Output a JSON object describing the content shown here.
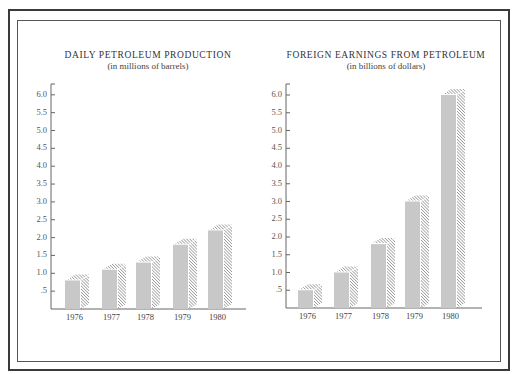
{
  "header": {
    "partial_heading": "GROWTH OF PETROLEUM SECTOR"
  },
  "colors": {
    "bar_fill": "#c8c8c8",
    "hatch": "#555555",
    "axis": "#666666",
    "frame": "#3a3a3a"
  },
  "chart_data": [
    {
      "type": "bar",
      "title": "DAILY PETROLEUM PRODUCTION",
      "subtitle": "(in millions of barrels)",
      "xlabel": "",
      "ylabel": "",
      "categories": [
        "1976",
        "1977",
        "1978",
        "1979",
        "1980"
      ],
      "values": [
        0.8,
        1.1,
        1.3,
        1.8,
        2.2
      ],
      "ylim": [
        0,
        6.0
      ],
      "yticks": [
        ".5",
        "1.0",
        "1.5",
        "2.0",
        "2.5",
        "3.0",
        "3.5",
        "4.0",
        "4.5",
        "5.0",
        "5.5",
        "6.0"
      ],
      "grid": false,
      "style": "3d bars with hatched sides"
    },
    {
      "type": "bar",
      "title": "FOREIGN EARNINGS FROM PETROLEUM",
      "subtitle": "(in billions of dollars)",
      "xlabel": "",
      "ylabel": "",
      "categories": [
        "1976",
        "1977",
        "1978",
        "1979",
        "1980"
      ],
      "values": [
        0.5,
        1.0,
        1.8,
        3.0,
        6.0
      ],
      "ylim": [
        0,
        6.0
      ],
      "yticks": [
        ".5",
        "1.0",
        "1.5",
        "2.0",
        "2.5",
        "3.0",
        "3.5",
        "4.0",
        "4.5",
        "5.0",
        "5.5",
        "6.0"
      ],
      "grid": false,
      "style": "3d bars with hatched sides"
    }
  ]
}
